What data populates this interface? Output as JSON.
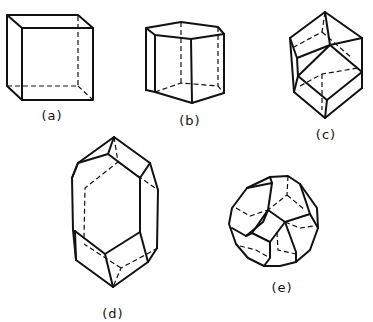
{
  "figure": {
    "panels": [
      {
        "id": "a",
        "label": "(a)",
        "shape": "cube"
      },
      {
        "id": "b",
        "label": "(b)",
        "shape": "hexagonal-prism"
      },
      {
        "id": "c",
        "label": "(c)",
        "shape": "rhombic-dodecahedron"
      },
      {
        "id": "d",
        "label": "(d)",
        "shape": "elongated-dodecahedron"
      },
      {
        "id": "e",
        "label": "(e)",
        "shape": "truncated-octahedron"
      }
    ],
    "colors": {
      "line": "#111111",
      "background": "#ffffff"
    }
  }
}
